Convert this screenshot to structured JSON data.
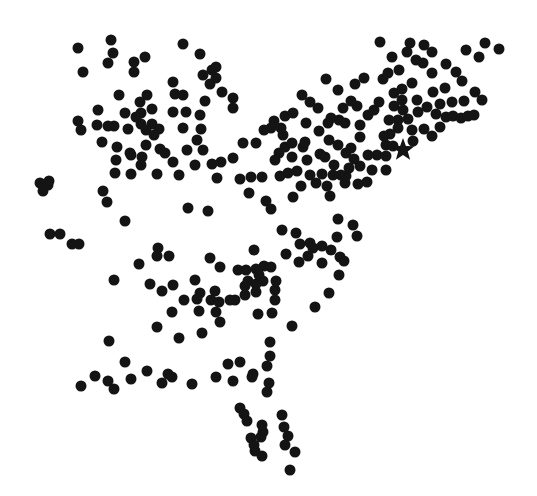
{
  "map": {
    "width": 537,
    "height": 496,
    "background": "#ffffff",
    "dot_color": "#141414",
    "dot_radius": 5.5,
    "star": {
      "x": 403,
      "y": 150,
      "r_outer": 12,
      "r_inner": 5,
      "icon": "star-marker-icon"
    },
    "dots": [
      [
        78,
        48
      ],
      [
        111,
        40
      ],
      [
        113,
        53
      ],
      [
        108,
        63
      ],
      [
        83,
        72
      ],
      [
        134,
        62
      ],
      [
        145,
        57
      ],
      [
        134,
        72
      ],
      [
        183,
        44
      ],
      [
        200,
        54
      ],
      [
        212,
        70
      ],
      [
        216,
        67
      ],
      [
        203,
        75
      ],
      [
        210,
        84
      ],
      [
        216,
        78
      ],
      [
        222,
        92
      ],
      [
        233,
        98
      ],
      [
        233,
        108
      ],
      [
        173,
        82
      ],
      [
        183,
        95
      ],
      [
        175,
        94
      ],
      [
        205,
        101
      ],
      [
        186,
        112
      ],
      [
        200,
        115
      ],
      [
        183,
        128
      ],
      [
        201,
        129
      ],
      [
        197,
        140
      ],
      [
        173,
        112
      ],
      [
        187,
        150
      ],
      [
        160,
        149
      ],
      [
        119,
        95
      ],
      [
        147,
        95
      ],
      [
        140,
        102
      ],
      [
        152,
        109
      ],
      [
        141,
        113
      ],
      [
        141,
        124
      ],
      [
        152,
        124
      ],
      [
        146,
        130
      ],
      [
        159,
        129
      ],
      [
        154,
        135
      ],
      [
        125,
        113
      ],
      [
        114,
        126
      ],
      [
        108,
        126
      ],
      [
        97,
        125
      ],
      [
        98,
        110
      ],
      [
        102,
        142
      ],
      [
        128,
        129
      ],
      [
        136,
        117
      ],
      [
        146,
        145
      ],
      [
        131,
        155
      ],
      [
        130,
        153
      ],
      [
        142,
        157
      ],
      [
        117,
        147
      ],
      [
        116,
        160
      ],
      [
        115,
        173
      ],
      [
        131,
        174
      ],
      [
        141,
        165
      ],
      [
        157,
        174
      ],
      [
        165,
        153
      ],
      [
        173,
        162
      ],
      [
        179,
        175
      ],
      [
        195,
        165
      ],
      [
        203,
        150
      ],
      [
        212,
        164
      ],
      [
        221,
        162
      ],
      [
        217,
        178
      ],
      [
        233,
        158
      ],
      [
        243,
        143
      ],
      [
        256,
        143
      ],
      [
        264,
        130
      ],
      [
        274,
        121
      ],
      [
        271,
        128
      ],
      [
        285,
        116
      ],
      [
        283,
        135
      ],
      [
        262,
        177
      ],
      [
        251,
        177
      ],
      [
        240,
        179
      ],
      [
        249,
        193
      ],
      [
        266,
        201
      ],
      [
        271,
        209
      ],
      [
        78,
        121
      ],
      [
        81,
        130
      ],
      [
        40,
        183
      ],
      [
        49,
        181
      ],
      [
        43,
        191
      ],
      [
        103,
        191
      ],
      [
        107,
        202
      ],
      [
        125,
        221
      ],
      [
        208,
        211
      ],
      [
        188,
        208
      ],
      [
        50,
        234
      ],
      [
        60,
        234
      ],
      [
        72,
        244
      ],
      [
        79,
        244
      ],
      [
        48,
        185
      ],
      [
        281,
        128
      ],
      [
        293,
        113
      ],
      [
        302,
        95
      ],
      [
        310,
        102
      ],
      [
        306,
        123
      ],
      [
        318,
        108
      ],
      [
        303,
        147
      ],
      [
        285,
        147
      ],
      [
        292,
        157
      ],
      [
        288,
        173
      ],
      [
        301,
        186
      ],
      [
        293,
        197
      ],
      [
        280,
        176
      ],
      [
        326,
        79
      ],
      [
        338,
        90
      ],
      [
        331,
        118
      ],
      [
        345,
        123
      ],
      [
        338,
        145
      ],
      [
        325,
        157
      ],
      [
        351,
        148
      ],
      [
        360,
        137
      ],
      [
        368,
        155
      ],
      [
        384,
        136
      ],
      [
        389,
        120
      ],
      [
        379,
        102
      ],
      [
        383,
        79
      ],
      [
        402,
        89
      ],
      [
        412,
        83
      ],
      [
        410,
        43
      ],
      [
        407,
        52
      ],
      [
        380,
        42
      ],
      [
        392,
        57
      ],
      [
        388,
        73
      ],
      [
        423,
        63
      ],
      [
        432,
        73
      ],
      [
        433,
        92
      ],
      [
        417,
        100
      ],
      [
        427,
        107
      ],
      [
        440,
        104
      ],
      [
        446,
        117
      ],
      [
        440,
        127
      ],
      [
        432,
        136
      ],
      [
        424,
        129
      ],
      [
        412,
        130
      ],
      [
        408,
        119
      ],
      [
        398,
        120
      ],
      [
        394,
        106
      ],
      [
        398,
        128
      ],
      [
        390,
        134
      ],
      [
        386,
        145
      ],
      [
        377,
        155
      ],
      [
        372,
        170
      ],
      [
        386,
        170
      ],
      [
        367,
        182
      ],
      [
        358,
        184
      ],
      [
        345,
        183
      ],
      [
        341,
        175
      ],
      [
        334,
        165
      ],
      [
        322,
        174
      ],
      [
        327,
        186
      ],
      [
        330,
        196
      ],
      [
        316,
        183
      ],
      [
        333,
        175
      ],
      [
        346,
        176
      ],
      [
        349,
        168
      ],
      [
        360,
        166
      ],
      [
        386,
        156
      ],
      [
        393,
        146
      ],
      [
        446,
        64
      ],
      [
        456,
        72
      ],
      [
        466,
        50
      ],
      [
        479,
        57
      ],
      [
        485,
        43
      ],
      [
        499,
        49
      ],
      [
        445,
        88
      ],
      [
        452,
        102
      ],
      [
        464,
        101
      ],
      [
        475,
        92
      ],
      [
        482,
        100
      ],
      [
        461,
        118
      ],
      [
        453,
        116
      ],
      [
        436,
        114
      ],
      [
        468,
        116
      ],
      [
        474,
        115
      ],
      [
        462,
        81
      ],
      [
        432,
        52
      ],
      [
        424,
        45
      ],
      [
        416,
        60
      ],
      [
        399,
        70
      ],
      [
        402,
        100
      ],
      [
        364,
        78
      ],
      [
        355,
        84
      ],
      [
        351,
        101
      ],
      [
        357,
        106
      ],
      [
        343,
        108
      ],
      [
        328,
        123
      ],
      [
        339,
        120
      ],
      [
        319,
        131
      ],
      [
        329,
        140
      ],
      [
        305,
        142
      ],
      [
        320,
        154
      ],
      [
        354,
        159
      ],
      [
        346,
        153
      ],
      [
        360,
        125
      ],
      [
        368,
        115
      ],
      [
        374,
        110
      ],
      [
        394,
        93
      ],
      [
        403,
        110
      ],
      [
        418,
        112
      ],
      [
        413,
        141
      ],
      [
        279,
        153
      ],
      [
        292,
        143
      ],
      [
        275,
        160
      ],
      [
        297,
        171
      ],
      [
        310,
        175
      ],
      [
        307,
        160
      ],
      [
        282,
        230
      ],
      [
        296,
        233
      ],
      [
        300,
        244
      ],
      [
        286,
        254
      ],
      [
        299,
        262
      ],
      [
        308,
        256
      ],
      [
        313,
        248
      ],
      [
        322,
        246
      ],
      [
        322,
        263
      ],
      [
        331,
        250
      ],
      [
        337,
        237
      ],
      [
        340,
        257
      ],
      [
        344,
        261
      ],
      [
        353,
        225
      ],
      [
        357,
        236
      ],
      [
        329,
        293
      ],
      [
        315,
        307
      ],
      [
        338,
        219
      ],
      [
        339,
        275
      ],
      [
        310,
        243
      ],
      [
        158,
        248
      ],
      [
        157,
        256
      ],
      [
        169,
        256
      ],
      [
        139,
        264
      ],
      [
        114,
        280
      ],
      [
        150,
        284
      ],
      [
        162,
        291
      ],
      [
        173,
        285
      ],
      [
        195,
        280
      ],
      [
        210,
        258
      ],
      [
        220,
        267
      ],
      [
        215,
        291
      ],
      [
        211,
        300
      ],
      [
        219,
        302
      ],
      [
        235,
        300
      ],
      [
        220,
        322
      ],
      [
        256,
        269
      ],
      [
        246,
        270
      ],
      [
        248,
        281
      ],
      [
        245,
        286
      ],
      [
        256,
        284
      ],
      [
        256,
        292
      ],
      [
        245,
        295
      ],
      [
        259,
        275
      ],
      [
        254,
        250
      ],
      [
        238,
        270
      ],
      [
        200,
        293
      ],
      [
        197,
        299
      ],
      [
        184,
        300
      ],
      [
        172,
        312
      ],
      [
        157,
        327
      ],
      [
        179,
        338
      ],
      [
        202,
        333
      ],
      [
        216,
        312
      ],
      [
        199,
        311
      ],
      [
        230,
        300
      ],
      [
        275,
        290
      ],
      [
        275,
        300
      ],
      [
        272,
        313
      ],
      [
        258,
        314
      ],
      [
        276,
        281
      ],
      [
        292,
        326
      ],
      [
        264,
        266
      ],
      [
        263,
        281
      ],
      [
        271,
        267
      ],
      [
        109,
        341
      ],
      [
        125,
        362
      ],
      [
        95,
        376
      ],
      [
        81,
        386
      ],
      [
        108,
        381
      ],
      [
        114,
        389
      ],
      [
        131,
        379
      ],
      [
        147,
        371
      ],
      [
        162,
        383
      ],
      [
        168,
        374
      ],
      [
        172,
        377
      ],
      [
        192,
        384
      ],
      [
        216,
        377
      ],
      [
        233,
        381
      ],
      [
        240,
        362
      ],
      [
        253,
        374
      ],
      [
        228,
        364
      ],
      [
        270,
        356
      ],
      [
        267,
        366
      ],
      [
        269,
        383
      ],
      [
        267,
        392
      ],
      [
        252,
        377
      ],
      [
        270,
        342
      ],
      [
        240,
        408
      ],
      [
        244,
        414
      ],
      [
        247,
        421
      ],
      [
        262,
        425
      ],
      [
        263,
        432
      ],
      [
        251,
        438
      ],
      [
        254,
        445
      ],
      [
        261,
        437
      ],
      [
        255,
        451
      ],
      [
        282,
        415
      ],
      [
        284,
        427
      ],
      [
        288,
        436
      ],
      [
        285,
        445
      ],
      [
        262,
        456
      ],
      [
        295,
        452
      ],
      [
        290,
        470
      ]
    ]
  }
}
